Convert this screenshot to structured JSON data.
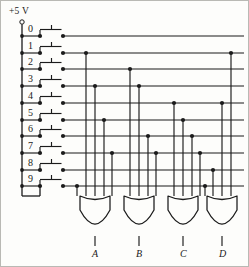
{
  "diagram": {
    "supply_label": "+5 V",
    "line_color": "#1b1b1b",
    "background_color": "#fdfdfb",
    "border_color": "#b9b9b4"
  },
  "inputs": {
    "caption": "decimal input switches",
    "rows": [
      {
        "label": "0",
        "y": 36
      },
      {
        "label": "1",
        "y": 53
      },
      {
        "label": "2",
        "y": 69
      },
      {
        "label": "3",
        "y": 86
      },
      {
        "label": "4",
        "y": 103
      },
      {
        "label": "5",
        "y": 120
      },
      {
        "label": "6",
        "y": 136
      },
      {
        "label": "7",
        "y": 153
      },
      {
        "label": "8",
        "y": 170
      },
      {
        "label": "9",
        "y": 186
      }
    ]
  },
  "outputs": {
    "gates": [
      {
        "label": "A",
        "gate_type": "OR",
        "x": 95,
        "inputs": [
          "1",
          "3",
          "5",
          "7",
          "9"
        ]
      },
      {
        "label": "B",
        "gate_type": "OR",
        "x": 139,
        "inputs": [
          "2",
          "3",
          "6",
          "7"
        ]
      },
      {
        "label": "C",
        "gate_type": "OR",
        "x": 183,
        "inputs": [
          "4",
          "5",
          "6",
          "7"
        ]
      },
      {
        "label": "D",
        "gate_type": "OR",
        "x": 222,
        "inputs": [
          "8",
          "9"
        ]
      }
    ]
  },
  "wiring": {
    "rail_x": 22,
    "switch_left_x": 40,
    "switch_right_x": 63,
    "bus_end_x": 244,
    "taps": [
      {
        "row": "1",
        "x": 86,
        "gate": "A"
      },
      {
        "row": "3",
        "x": 95,
        "gate": "A"
      },
      {
        "row": "5",
        "x": 104,
        "gate": "A"
      },
      {
        "row": "7",
        "x": 112,
        "gate": "A"
      },
      {
        "row": "9",
        "x": 77,
        "gate": "A"
      },
      {
        "row": "2",
        "x": 130,
        "gate": "B"
      },
      {
        "row": "3",
        "x": 139,
        "gate": "B"
      },
      {
        "row": "6",
        "x": 148,
        "gate": "B"
      },
      {
        "row": "7",
        "x": 156,
        "gate": "B"
      },
      {
        "row": "4",
        "x": 174,
        "gate": "C"
      },
      {
        "row": "5",
        "x": 183,
        "gate": "C"
      },
      {
        "row": "6",
        "x": 192,
        "gate": "C"
      },
      {
        "row": "7",
        "x": 200,
        "gate": "C"
      },
      {
        "row": "8",
        "x": 213,
        "gate": "D"
      },
      {
        "row": "9",
        "x": 205,
        "gate": "D"
      },
      {
        "row": "1",
        "x": 231,
        "gate": "D"
      },
      {
        "row": "4",
        "x": 222,
        "gate": "D"
      }
    ]
  }
}
